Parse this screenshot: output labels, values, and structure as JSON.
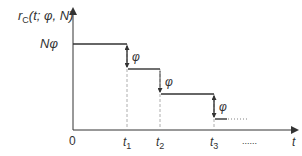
{
  "diagram": {
    "y_axis_label": {
      "main": "r",
      "sub": "C",
      "args": "(t; φ, N)"
    },
    "x_axis_label": "t",
    "origin_label": "0",
    "initial_level_label": "Nφ",
    "step_label": "φ",
    "time_ticks": [
      {
        "main": "t",
        "sub": "1"
      },
      {
        "main": "t",
        "sub": "2"
      },
      {
        "main": "t",
        "sub": "3"
      }
    ],
    "continuation": "......",
    "colors": {
      "line": "#333333",
      "dashed": "#888888",
      "background": "#ffffff"
    }
  }
}
